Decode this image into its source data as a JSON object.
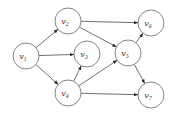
{
  "diagram": {
    "type": "directed-graph",
    "nodes": [
      {
        "id": "v1",
        "label": "v",
        "sub": "1",
        "x": 26,
        "y": 56
      },
      {
        "id": "v2",
        "label": "v",
        "sub": "2",
        "x": 68,
        "y": 21
      },
      {
        "id": "v3",
        "label": "v",
        "sub": "3",
        "x": 87,
        "y": 54
      },
      {
        "id": "v4",
        "label": "v",
        "sub": "4",
        "x": 68,
        "y": 93
      },
      {
        "id": "v5",
        "label": "v",
        "sub": "5",
        "x": 128,
        "y": 53
      },
      {
        "id": "v6",
        "label": "v",
        "sub": "6",
        "x": 151,
        "y": 23
      },
      {
        "id": "v7",
        "label": "v",
        "sub": "7",
        "x": 151,
        "y": 95
      }
    ],
    "edges": [
      {
        "from": "v1",
        "to": "v2"
      },
      {
        "from": "v1",
        "to": "v3"
      },
      {
        "from": "v1",
        "to": "v4"
      },
      {
        "from": "v2",
        "to": "v6"
      },
      {
        "from": "v2",
        "to": "v5"
      },
      {
        "from": "v4",
        "to": "v3"
      },
      {
        "from": "v4",
        "to": "v5"
      },
      {
        "from": "v4",
        "to": "v7"
      },
      {
        "from": "v5",
        "to": "v6"
      },
      {
        "from": "v5",
        "to": "v7"
      }
    ],
    "node_radius": 13,
    "colors": {
      "stroke": "#666666",
      "edge": "#333333",
      "text": "#333333",
      "background": "#ffffff"
    }
  }
}
